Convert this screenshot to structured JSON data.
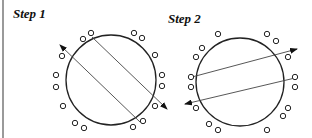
{
  "steps": [
    {
      "label": "Step 1",
      "circle": {
        "cx": 111,
        "cy": 80,
        "r": 45
      },
      "small_circles": [
        [
          83,
          39
        ],
        [
          91,
          33
        ],
        [
          134,
          33
        ],
        [
          142,
          38
        ],
        [
          155,
          55
        ],
        [
          162,
          75
        ],
        [
          162,
          86
        ],
        [
          155,
          106
        ],
        [
          62,
          56
        ],
        [
          56,
          75
        ],
        [
          56,
          87
        ],
        [
          63,
          106
        ],
        [
          75,
          123
        ],
        [
          84,
          128
        ],
        [
          133,
          127
        ],
        [
          143,
          121
        ]
      ],
      "lines": [
        {
          "from": [
            140,
            122
          ],
          "to": [
            60,
            45
          ],
          "arrow": "end"
        },
        {
          "from": [
            92,
            37
          ],
          "to": [
            167,
            109
          ],
          "arrow": "end"
        }
      ]
    },
    {
      "label": "Step 2",
      "circle": {
        "cx": 240,
        "cy": 82,
        "r": 44
      },
      "small_circles": [
        [
          218,
          34
        ],
        [
          202,
          48
        ],
        [
          196,
          57
        ],
        [
          267,
          34
        ],
        [
          276,
          41
        ],
        [
          288,
          57
        ],
        [
          191,
          77
        ],
        [
          191,
          87
        ],
        [
          295,
          77
        ],
        [
          295,
          87
        ],
        [
          196,
          108
        ],
        [
          288,
          108
        ],
        [
          283,
          116
        ],
        [
          209,
          124
        ],
        [
          218,
          130
        ],
        [
          267,
          130
        ]
      ],
      "lines": [
        {
          "from": [
            192,
            77
          ],
          "to": [
            297,
            49
          ],
          "arrow": "end"
        },
        {
          "from": [
            295,
            78
          ],
          "to": [
            185,
            104
          ],
          "arrow": "end"
        }
      ]
    }
  ],
  "colors": {
    "stroke": "#222222",
    "line": "#444444",
    "bar": "#9a9a9a"
  }
}
